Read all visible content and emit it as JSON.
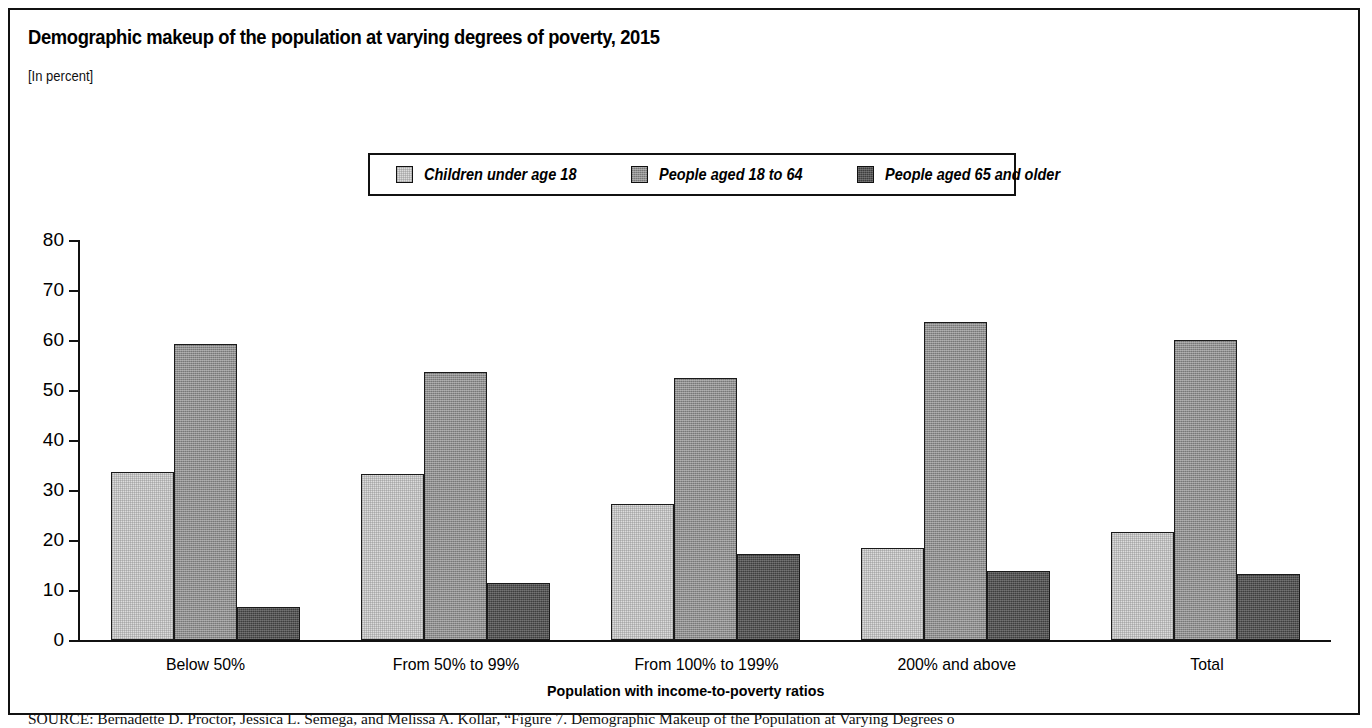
{
  "figure": {
    "title": "Demographic makeup of the population at varying degrees of poverty, 2015",
    "subtitle": "[In percent]",
    "source_kicker": "SOURCE:",
    "source_text": " Bernadette D. Proctor, Jessica L. Semega, and Melissa A. Kollar, “Figure 7. Demographic Makeup of the Population at Varying Degrees o"
  },
  "legend": {
    "items": [
      {
        "label": "Children under age 18",
        "swatch": "light-gray-swatch",
        "color": "#dcdcdc"
      },
      {
        "label": "People aged 18 to 64",
        "swatch": "medium-gray-swatch",
        "color": "#8e8e8e"
      },
      {
        "label": "People aged 65 and older",
        "swatch": "dark-gray-swatch",
        "color": "#3e3e3e"
      }
    ]
  },
  "chart_data": {
    "type": "bar",
    "title": "Demographic makeup of the population at varying degrees of poverty, 2015",
    "subtitle": "[In percent]",
    "xlabel": "Population with income-to-poverty ratios",
    "ylabel": "",
    "ylim": [
      0,
      80
    ],
    "yticks": [
      0,
      10,
      20,
      30,
      40,
      50,
      60,
      70,
      80
    ],
    "ytick_labels": [
      "0",
      "10",
      "20",
      "30",
      "40",
      "50",
      "60",
      "70",
      "80"
    ],
    "grid": false,
    "legend_position": "top-center",
    "categories": [
      "Below 50%",
      "From 50% to 99%",
      "From 100% to 199%",
      "200% and above",
      "Total"
    ],
    "series": [
      {
        "name": "Children under age 18",
        "values": [
          33.6,
          33.2,
          27.3,
          18.5,
          21.6
        ]
      },
      {
        "name": "People aged 18 to 64",
        "values": [
          59.3,
          53.6,
          52.4,
          63.7,
          60.1
        ]
      },
      {
        "name": "People aged 65 and older",
        "values": [
          6.6,
          11.5,
          17.3,
          13.8,
          13.2
        ]
      }
    ]
  }
}
